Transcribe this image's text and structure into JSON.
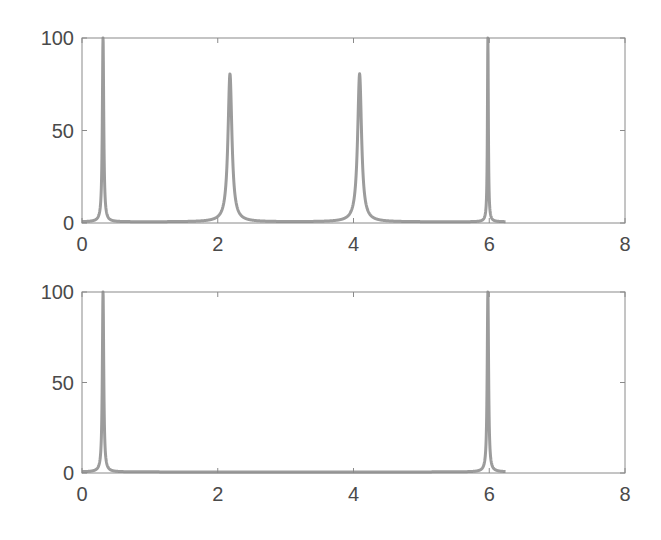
{
  "colors": {
    "line": "#9c9c9c",
    "axes": "#8a8a8a",
    "tick_label": "#4a4a4a",
    "background": "#ffffff"
  },
  "chart_data": [
    {
      "type": "line",
      "title": "",
      "xlabel": "",
      "ylabel": "",
      "xlim": [
        0,
        8
      ],
      "ylim": [
        0,
        100
      ],
      "xticks": [
        0,
        2,
        4,
        6,
        8
      ],
      "yticks": [
        0,
        50,
        100
      ],
      "xtick_labels": [
        "0",
        "2",
        "4",
        "6",
        "8"
      ],
      "ytick_labels": [
        "0",
        "50",
        "100"
      ],
      "grid": false,
      "legend": null,
      "x_range_of_data": [
        0,
        6.24
      ],
      "peaks": [
        {
          "x": 0.31,
          "y": 100,
          "width": 0.012
        },
        {
          "x": 2.18,
          "y": 80,
          "width": 0.035
        },
        {
          "x": 4.09,
          "y": 80,
          "width": 0.035
        },
        {
          "x": 5.98,
          "y": 100,
          "width": 0.008
        }
      ],
      "series": [
        {
          "name": "spectrum",
          "x": [
            0,
            0.2,
            0.28,
            0.31,
            0.34,
            0.5,
            1.0,
            1.5,
            2.0,
            2.1,
            2.18,
            2.26,
            2.4,
            3.0,
            3.5,
            3.9,
            4.0,
            4.09,
            4.18,
            4.3,
            5.0,
            5.8,
            5.95,
            5.98,
            6.01,
            6.1,
            6.24
          ],
          "y": [
            1,
            2,
            8,
            100,
            8,
            3,
            1,
            1,
            5,
            10,
            80,
            10,
            5,
            2,
            2,
            6,
            12,
            80,
            12,
            5,
            1,
            2,
            8,
            100,
            3,
            1,
            1
          ]
        }
      ]
    },
    {
      "type": "line",
      "title": "",
      "xlabel": "",
      "ylabel": "",
      "xlim": [
        0,
        8
      ],
      "ylim": [
        0,
        100
      ],
      "xticks": [
        0,
        2,
        4,
        6,
        8
      ],
      "yticks": [
        0,
        50,
        100
      ],
      "xtick_labels": [
        "0",
        "2",
        "4",
        "6",
        "8"
      ],
      "ytick_labels": [
        "0",
        "50",
        "100"
      ],
      "grid": false,
      "legend": null,
      "x_range_of_data": [
        0,
        6.24
      ],
      "peaks": [
        {
          "x": 0.31,
          "y": 100,
          "width": 0.012
        },
        {
          "x": 5.98,
          "y": 100,
          "width": 0.012
        }
      ],
      "series": [
        {
          "name": "spectrum",
          "x": [
            0,
            0.2,
            0.28,
            0.31,
            0.34,
            0.5,
            1.0,
            2.0,
            3.0,
            4.0,
            5.0,
            5.5,
            5.9,
            5.98,
            6.02,
            6.1,
            6.24
          ],
          "y": [
            2,
            2,
            8,
            100,
            8,
            4,
            2,
            1,
            0.5,
            0.5,
            1,
            2,
            6,
            100,
            2,
            1,
            1
          ]
        }
      ]
    }
  ]
}
